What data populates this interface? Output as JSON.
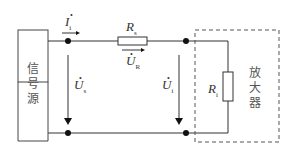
{
  "diagram": {
    "type": "circuit",
    "source_block": {
      "label": [
        "信",
        "号",
        "源"
      ]
    },
    "amplifier_block": {
      "label": [
        "放",
        "大",
        "器"
      ],
      "border": "dashed"
    },
    "labels": {
      "current_in": {
        "symbol": "I",
        "sub": "i"
      },
      "series_resistor": {
        "symbol": "R",
        "sub": "s"
      },
      "resistor_voltage": {
        "symbol": "U",
        "sub": "R"
      },
      "source_voltage": {
        "symbol": "U",
        "sub": "s"
      },
      "input_voltage": {
        "symbol": "U",
        "sub": "i"
      },
      "input_resistor": {
        "symbol": "R",
        "sub": "i"
      }
    },
    "colors": {
      "line": "#333333",
      "dashed": "#555555"
    }
  }
}
